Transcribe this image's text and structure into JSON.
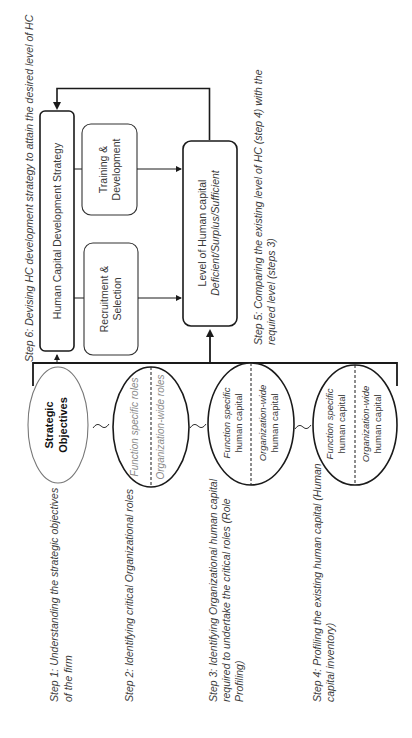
{
  "diagram": {
    "title_step6": "Step 6: Devising HC development strategy to attain the desired level of HC",
    "step5": {
      "line1": "Step 5: Comparing the existing level of HC (step 4) with the",
      "line2": "required level (steps 3)"
    },
    "hcds_box": {
      "label": "Human Capital Development Strategy"
    },
    "training_box": {
      "line1": "Training &",
      "line2": "Development"
    },
    "recruitment_box": {
      "line1": "Recruitment &",
      "line2": "Selection"
    },
    "level_box": {
      "line1": "Level of Human capital",
      "line2": "Deficient/Surplus/Sufficient"
    },
    "ellipses": [
      {
        "id": "strategic",
        "line1": "Strategic",
        "line2": "Objectives"
      },
      {
        "id": "roles",
        "left": "Function specific roles",
        "right": "Organization-wide roles"
      },
      {
        "id": "required-hc",
        "left1": "Function specific",
        "left2": "human capital",
        "right1": "Organization-wide",
        "right2": "human capital"
      },
      {
        "id": "existing-hc",
        "left1": "Function specific",
        "left2": "human capital",
        "right1": "Organization-wide",
        "right2": "human capital"
      }
    ],
    "steps": [
      {
        "line1": "Step 1: Understanding the strategic objectives",
        "line2": "of the firm",
        "line3": ""
      },
      {
        "line1": "Step 2: Identifying critical Organizational roles",
        "line2": "",
        "line3": ""
      },
      {
        "line1": "Step 3: Identifying Organizational human capital",
        "line2": "required to undertake the critical roles (Role",
        "line3": "Profiling)"
      },
      {
        "line1": "Step 4: Profiling the existing human capital (Human",
        "line2": "capital inventory)",
        "line3": ""
      }
    ],
    "colors": {
      "stroke": "#1a1a1a",
      "text": "#3a3a3a",
      "muted_text": "#8a8a8a",
      "background": "#ffffff"
    }
  }
}
